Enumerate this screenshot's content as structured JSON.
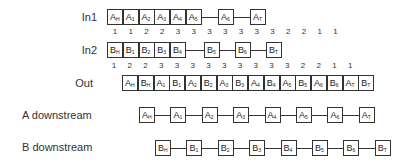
{
  "rows": {
    "in1": {
      "label": "In1",
      "boxes": [
        {
          "letter": "A",
          "sub": "H"
        },
        {
          "letter": "A",
          "sub": "1"
        },
        {
          "letter": "A",
          "sub": "2"
        },
        {
          "letter": "A",
          "sub": "3"
        },
        {
          "letter": "A",
          "sub": "4"
        },
        {
          "letter": "A",
          "sub": "5"
        },
        {
          "letter": "A",
          "sub": "6"
        },
        {
          "letter": "A",
          "sub": "T"
        }
      ],
      "counts": [
        "1",
        "1",
        "2",
        "2",
        "3",
        "3",
        "3",
        "3",
        "3",
        "3",
        "3",
        "2",
        "2",
        "1",
        "1"
      ]
    },
    "in2": {
      "label": "In2",
      "boxes": [
        {
          "letter": "B",
          "sub": "H"
        },
        {
          "letter": "B",
          "sub": "1"
        },
        {
          "letter": "B",
          "sub": "2"
        },
        {
          "letter": "B",
          "sub": "3"
        },
        {
          "letter": "B",
          "sub": "4"
        },
        {
          "letter": "B",
          "sub": "5"
        },
        {
          "letter": "B",
          "sub": "6"
        },
        {
          "letter": "B",
          "sub": "T"
        }
      ],
      "counts": [
        "1",
        "2",
        "2",
        "3",
        "3",
        "3",
        "3",
        "3",
        "3",
        "3",
        "3",
        "3",
        "2",
        "2",
        "1",
        "1"
      ]
    },
    "out": {
      "label": "Out",
      "boxes": [
        {
          "letter": "A",
          "sub": "H"
        },
        {
          "letter": "B",
          "sub": "H"
        },
        {
          "letter": "A",
          "sub": "1"
        },
        {
          "letter": "B",
          "sub": "1"
        },
        {
          "letter": "A",
          "sub": "2"
        },
        {
          "letter": "B",
          "sub": "2"
        },
        {
          "letter": "A",
          "sub": "3"
        },
        {
          "letter": "B",
          "sub": "3"
        },
        {
          "letter": "A",
          "sub": "4"
        },
        {
          "letter": "B",
          "sub": "4"
        },
        {
          "letter": "A",
          "sub": "5"
        },
        {
          "letter": "B",
          "sub": "5"
        },
        {
          "letter": "A",
          "sub": "6"
        },
        {
          "letter": "B",
          "sub": "6"
        },
        {
          "letter": "A",
          "sub": "T"
        },
        {
          "letter": "B",
          "sub": "T"
        }
      ]
    },
    "a_down": {
      "label": "A downstream",
      "boxes": [
        {
          "letter": "A",
          "sub": "H"
        },
        {
          "letter": "A",
          "sub": "1"
        },
        {
          "letter": "A",
          "sub": "2"
        },
        {
          "letter": "A",
          "sub": "3"
        },
        {
          "letter": "A",
          "sub": "4"
        },
        {
          "letter": "A",
          "sub": "5"
        },
        {
          "letter": "A",
          "sub": "6"
        },
        {
          "letter": "A",
          "sub": "T"
        }
      ]
    },
    "b_down": {
      "label": "B downstream",
      "boxes": [
        {
          "letter": "B",
          "sub": "H"
        },
        {
          "letter": "B",
          "sub": "1"
        },
        {
          "letter": "B",
          "sub": "2"
        },
        {
          "letter": "B",
          "sub": "3"
        },
        {
          "letter": "B",
          "sub": "4"
        },
        {
          "letter": "B",
          "sub": "5"
        },
        {
          "letter": "B",
          "sub": "6"
        },
        {
          "letter": "B",
          "sub": "T"
        }
      ]
    }
  }
}
